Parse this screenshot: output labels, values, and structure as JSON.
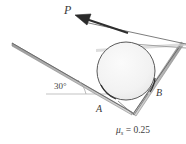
{
  "figure": {
    "type": "statics-free-body-diagram",
    "labels": {
      "force": "P",
      "contact_lower": "A",
      "contact_upper": "B",
      "incline_angle": "30°",
      "friction_mu": "μ",
      "friction_subscript": "s",
      "friction_equals": " = ",
      "friction_value": "0.25",
      "friction_full": "μs = 0.25"
    },
    "colors": {
      "line": "#6e6e6e",
      "line_dark": "#4a4a4a",
      "circle_stroke": "#5a5a5a",
      "circle_fill": "#f2f2f2",
      "arrow": "#2e2e2e",
      "text": "#3a3a3a",
      "reference_line": "#b9b9b9",
      "background": "#ffffff"
    },
    "geometry": {
      "circle_center_x": 126,
      "circle_center_y": 71,
      "circle_radius": 29,
      "incline_angle_deg": 30,
      "contact_A_x": 106,
      "contact_A_y": 96,
      "contact_B_x": 152,
      "contact_B_y": 85,
      "arrow_tip_x": 76,
      "arrow_tip_y": 16,
      "arrow_tail_x": 186,
      "arrow_tail_y": 45
    }
  }
}
